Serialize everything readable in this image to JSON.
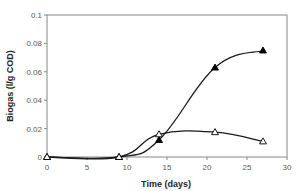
{
  "chart_data": {
    "type": "scatter",
    "title": "",
    "xlabel": "Time (days)",
    "ylabel": "Biogas (l/g COD)",
    "xlim": [
      0,
      30
    ],
    "ylim": [
      0,
      0.1
    ],
    "xticks": [
      0,
      5,
      10,
      15,
      20,
      25,
      30
    ],
    "yticks": [
      0,
      0.02,
      0.04,
      0.06,
      0.08,
      0.1
    ],
    "xtick_labels": [
      "0",
      "5",
      "10",
      "15",
      "20",
      "25",
      "30"
    ],
    "ytick_labels": [
      "0",
      "0.02",
      "0.04",
      "0.06",
      "0.08",
      "0.1"
    ],
    "grid": false,
    "legend": null,
    "series": [
      {
        "name": "filled-triangle",
        "marker": "filled-triangle",
        "color": "#000000",
        "line": "smooth",
        "x": [
          0,
          9,
          14,
          21,
          27
        ],
        "y": [
          0,
          0,
          0.012,
          0.063,
          0.075
        ]
      },
      {
        "name": "open-triangle",
        "marker": "open-triangle",
        "color": "#000000",
        "line": "smooth",
        "x": [
          0,
          9,
          14,
          21,
          27
        ],
        "y": [
          0,
          0,
          0.016,
          0.0175,
          0.011
        ]
      }
    ]
  },
  "colors": {
    "axis": "#868686",
    "line": "#1a1a1a",
    "tick_text": "#595959",
    "title_text": "#262626"
  }
}
